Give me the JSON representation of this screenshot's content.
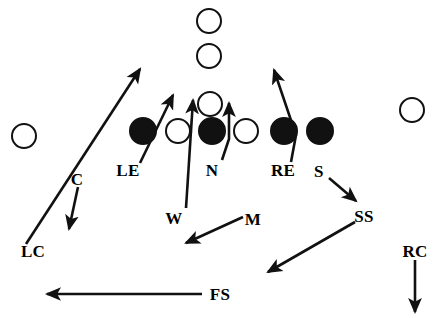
{
  "diagram": {
    "width": 439,
    "height": 318,
    "background_color": "#ffffff",
    "ink_color": "#111111",
    "offense_fill": "#ffffff",
    "defense_fill": "#111111"
  },
  "players": [
    {
      "key": "offense-receiver-deep",
      "team": "offense",
      "symbol": "open-circle",
      "cx": 209,
      "cy": 21,
      "r": 13
    },
    {
      "key": "offense-receiver-mid",
      "team": "offense",
      "symbol": "open-circle",
      "cx": 209,
      "cy": 56,
      "r": 13
    },
    {
      "key": "offense-quarterback",
      "team": "offense",
      "symbol": "open-circle",
      "cx": 210,
      "cy": 104,
      "r": 13
    },
    {
      "key": "offense-wide-left",
      "team": "offense",
      "symbol": "open-circle",
      "cx": 24,
      "cy": 136,
      "r": 13
    },
    {
      "key": "offense-wide-right",
      "team": "offense",
      "symbol": "open-circle",
      "cx": 412,
      "cy": 110,
      "r": 13
    },
    {
      "key": "offense-lineman-left",
      "team": "offense",
      "symbol": "open-circle",
      "cx": 178,
      "cy": 131,
      "r": 13
    },
    {
      "key": "offense-lineman-right",
      "team": "offense",
      "symbol": "open-circle",
      "cx": 246,
      "cy": 131,
      "r": 13
    },
    {
      "key": "defense-left-end",
      "team": "defense",
      "symbol": "filled-circle",
      "cx": 143,
      "cy": 131,
      "r": 14
    },
    {
      "key": "defense-nose-tackle",
      "team": "defense",
      "symbol": "filled-circle",
      "cx": 212,
      "cy": 131,
      "r": 14
    },
    {
      "key": "defense-right-end",
      "team": "defense",
      "symbol": "filled-circle",
      "cx": 284,
      "cy": 131,
      "r": 14
    },
    {
      "key": "defense-strong-tackle",
      "team": "defense",
      "symbol": "filled-circle",
      "cx": 320,
      "cy": 131,
      "r": 14
    }
  ],
  "labels": [
    {
      "key": "label-lc",
      "text": "LC",
      "x": 33,
      "y": 251
    },
    {
      "key": "label-c",
      "text": "C",
      "x": 77,
      "y": 179
    },
    {
      "key": "label-le",
      "text": "LE",
      "x": 128,
      "y": 170
    },
    {
      "key": "label-w",
      "text": "W",
      "x": 174,
      "y": 218
    },
    {
      "key": "label-n",
      "text": "N",
      "x": 212,
      "y": 170
    },
    {
      "key": "label-m",
      "text": "M",
      "x": 253,
      "y": 219
    },
    {
      "key": "label-re",
      "text": "RE",
      "x": 283,
      "y": 170
    },
    {
      "key": "label-s",
      "text": "S",
      "x": 319,
      "y": 171
    },
    {
      "key": "label-ss",
      "text": "SS",
      "x": 364,
      "y": 216
    },
    {
      "key": "label-fs",
      "text": "FS",
      "x": 220,
      "y": 294
    },
    {
      "key": "label-rc",
      "text": "RC",
      "x": 415,
      "y": 251
    }
  ],
  "assignment_arrows": [
    {
      "key": "arrow-lc",
      "label": "LC",
      "description": "Left corner drops from deep outside up to the flat toward the left hash",
      "points": "26,244 140,69",
      "arrowhead": "end"
    },
    {
      "key": "arrow-c",
      "label": "C",
      "description": "Corner breaks down and to the outside",
      "points": "78,187 69,229",
      "arrowhead": "end"
    },
    {
      "key": "arrow-le",
      "label": "LE",
      "description": "Left end rushes up through the inside gap",
      "points": "140,163 173,95",
      "arrowhead": "end"
    },
    {
      "key": "arrow-w",
      "label": "W",
      "description": "Weak linebacker blitzes straight up the middle gap",
      "points": "186,208 193,100",
      "arrowhead": "end"
    },
    {
      "key": "arrow-n",
      "label": "N",
      "description": "Nose tackle slants from the label hook straight upfield",
      "points": "222,160 229,139 229,103",
      "arrowhead": "end"
    },
    {
      "key": "arrow-m",
      "label": "M",
      "description": "Mike linebacker drops back and to the left",
      "points": "243,217 186,243",
      "arrowhead": "end"
    },
    {
      "key": "arrow-re",
      "label": "RE",
      "description": "Right end loops from the label hook up through the outside gap",
      "points": "291,162 296,135 274,70",
      "arrowhead": "end"
    },
    {
      "key": "arrow-s",
      "label": "S",
      "description": "Safety rotates down and to the right toward the strong side",
      "points": "329,178 356,201",
      "arrowhead": "end"
    },
    {
      "key": "arrow-ss",
      "label": "SS",
      "description": "Strong safety drops back to the left across the middle",
      "points": "355,222 268,272",
      "arrowhead": "end"
    },
    {
      "key": "arrow-fs",
      "label": "FS",
      "description": "Free safety runs flat across the field to the left",
      "points": "202,294 47,294",
      "arrowhead": "end"
    },
    {
      "key": "arrow-rc",
      "label": "RC",
      "description": "Right corner drops straight back",
      "points": "415,260 415,312",
      "arrowhead": "end"
    }
  ]
}
